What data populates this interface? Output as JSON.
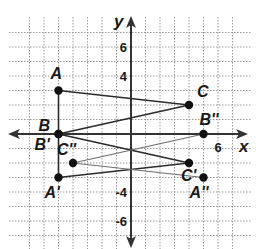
{
  "diagram": {
    "type": "coordinate-plane-transformations",
    "axes": {
      "x_label": "x",
      "y_label": "y",
      "x_ticks": [
        {
          "value": 6,
          "label": "6"
        }
      ],
      "y_ticks": [
        {
          "value": 6,
          "label": "6"
        },
        {
          "value": 4,
          "label": "4"
        },
        {
          "value": -4,
          "label": "-4"
        },
        {
          "value": -6,
          "label": "-6"
        }
      ],
      "grid_range": {
        "x": [
          -7,
          7
        ],
        "y": [
          -7,
          7
        ]
      }
    },
    "points": [
      {
        "id": "A",
        "label": "A",
        "x": -5,
        "y": 3
      },
      {
        "id": "B",
        "label": "B",
        "x": -5,
        "y": 0
      },
      {
        "id": "C",
        "label": "C",
        "x": 4,
        "y": 2
      },
      {
        "id": "A1",
        "label": "A'",
        "x": -5,
        "y": -3
      },
      {
        "id": "B1",
        "label": "B'",
        "x": -5,
        "y": 0
      },
      {
        "id": "C1",
        "label": "C'",
        "x": 4,
        "y": -2
      },
      {
        "id": "A2",
        "label": "A''",
        "x": 5,
        "y": -3
      },
      {
        "id": "B2",
        "label": "B''",
        "x": 5,
        "y": 0
      },
      {
        "id": "C2",
        "label": "C''",
        "x": -4,
        "y": -2
      }
    ],
    "segments": [
      {
        "from": "A",
        "to": "B",
        "weight": "dark"
      },
      {
        "from": "A",
        "to": "C",
        "weight": "dark"
      },
      {
        "from": "B",
        "to": "C",
        "weight": "dark"
      },
      {
        "from": "B1",
        "to": "A1",
        "weight": "dark"
      },
      {
        "from": "B1",
        "to": "C1",
        "weight": "dark"
      },
      {
        "from": "A1",
        "to": "C1",
        "weight": "dark"
      },
      {
        "from": "C2",
        "to": "B2",
        "weight": "light"
      },
      {
        "from": "C2",
        "to": "A2",
        "weight": "light"
      }
    ],
    "triangles": [
      {
        "name": "ABC",
        "vertices": [
          "A",
          "B",
          "C"
        ]
      },
      {
        "name": "A'B'C'",
        "vertices": [
          "A1",
          "B1",
          "C1"
        ]
      },
      {
        "name": "A''B''C''",
        "vertices": [
          "A2",
          "B2",
          "C2"
        ]
      }
    ],
    "colors": {
      "line_dark": "#2b2b2b",
      "line_light": "#6e6e6e",
      "grid": "#9a9a9a",
      "point": "#111111"
    }
  }
}
